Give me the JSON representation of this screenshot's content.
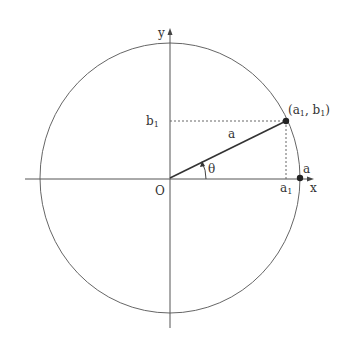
{
  "diagram": {
    "type": "unit-circle-polar",
    "colors": {
      "stroke": "#555555",
      "text": "#333333",
      "background": "#ffffff"
    },
    "labels": {
      "y_axis": "y",
      "x_axis": "x",
      "origin": "O",
      "b1": "b",
      "b1_sub": "1",
      "a1": "a",
      "a1_sub": "1",
      "radius": "a",
      "radius_on_axis": "a",
      "angle": "θ",
      "point_open": "(a",
      "point_sub1": "1",
      "point_mid": ", b",
      "point_sub2": "1",
      "point_close": ")"
    }
  }
}
